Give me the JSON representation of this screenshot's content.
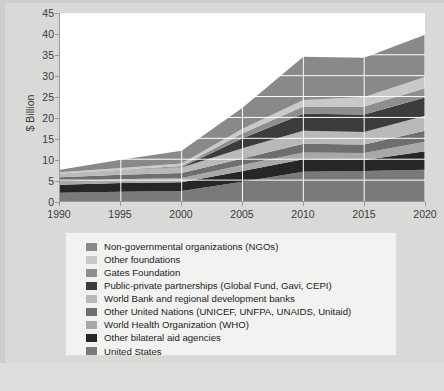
{
  "chart_data": {
    "type": "area",
    "stacked": true,
    "title": "",
    "subtitle": "",
    "xlabel": "",
    "ylabel": "$ Billion",
    "xlim": [
      1990,
      2020
    ],
    "ylim": [
      0,
      45
    ],
    "ytick_labels": [
      "0",
      "5",
      "10",
      "15",
      "20",
      "25",
      "30",
      "35",
      "40",
      "45"
    ],
    "ytick_values": [
      0,
      5,
      10,
      15,
      20,
      25,
      30,
      35,
      40,
      45
    ],
    "xtick_labels": [
      "1990",
      "1995",
      "2000",
      "2005",
      "2010",
      "2015",
      "2020"
    ],
    "xtick_values": [
      1990,
      1995,
      2000,
      2005,
      2010,
      2015,
      2020
    ],
    "grid": true,
    "grid_color": "#cfcfcf",
    "legend_position": "below",
    "x": [
      1990,
      1995,
      2000,
      2005,
      2010,
      2015,
      2020
    ],
    "series": [
      {
        "name": "United States",
        "color": "#7a7a78",
        "values": [
          2.0,
          2.2,
          2.4,
          4.6,
          7.0,
          7.2,
          7.5
        ]
      },
      {
        "name": "Other bilateral aid agencies",
        "color": "#262626",
        "values": [
          1.9,
          2.1,
          2.1,
          2.6,
          3.0,
          2.6,
          4.4
        ]
      },
      {
        "name": "World Health Organization (WHO)",
        "color": "#a8a8a6",
        "values": [
          0.8,
          0.9,
          1.0,
          1.4,
          1.6,
          1.7,
          2.3
        ]
      },
      {
        "name": "Other United Nations (UNICEF, UNFPA, UNAIDS, Unitaid)",
        "color": "#6e6e6c",
        "values": [
          1.0,
          1.1,
          1.2,
          1.6,
          2.1,
          2.0,
          2.6
        ]
      },
      {
        "name": "World Bank and regional development banks",
        "color": "#b9b9b7",
        "values": [
          0.9,
          1.1,
          1.3,
          2.4,
          3.1,
          3.0,
          3.6
        ]
      },
      {
        "name": "Public-private partnerships (Global Fund, Gavi, CEPI)",
        "color": "#3c3c3c",
        "values": [
          0.0,
          0.0,
          0.1,
          2.4,
          4.1,
          4.2,
          4.4
        ]
      },
      {
        "name": "Gates Foundation",
        "color": "#8e8e8c",
        "values": [
          0.0,
          0.1,
          0.3,
          1.2,
          1.7,
          1.9,
          2.2
        ]
      },
      {
        "name": "Other foundations",
        "color": "#c9c9c7",
        "values": [
          0.3,
          0.4,
          0.6,
          1.1,
          1.6,
          2.3,
          2.7
        ]
      },
      {
        "name": "Non-governmental organizations (NGOs)",
        "color": "#898987",
        "values": [
          0.6,
          2.0,
          3.0,
          5.0,
          10.3,
          9.4,
          10.1
        ]
      }
    ],
    "totals": [
      7.5,
      9.9,
      12.0,
      22.3,
      34.5,
      34.3,
      39.8
    ]
  },
  "legend": {
    "items": [
      {
        "label": "Non-governmental organizations (NGOs)",
        "color": "#898987"
      },
      {
        "label": "Other foundations",
        "color": "#c9c9c7"
      },
      {
        "label": "Gates Foundation",
        "color": "#8e8e8c"
      },
      {
        "label": "Public-private partnerships (Global Fund, Gavi, CEPI)",
        "color": "#3c3c3c"
      },
      {
        "label": "World Bank and regional development banks",
        "color": "#b9b9b7"
      },
      {
        "label": "Other United Nations (UNICEF, UNFPA, UNAIDS, Unitaid)",
        "color": "#6e6e6c"
      },
      {
        "label": "World Health Organization (WHO)",
        "color": "#a8a8a6"
      },
      {
        "label": "Other bilateral aid agencies",
        "color": "#262626"
      },
      {
        "label": "United States",
        "color": "#7a7a78"
      }
    ]
  }
}
